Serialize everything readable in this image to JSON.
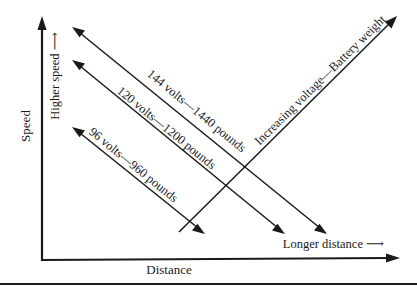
{
  "diagram": {
    "axes": {
      "y_label": "Speed",
      "x_label": "Distance",
      "y_direction_label": "Higher speed ⟶",
      "x_direction_label": "Longer distance ⟶"
    },
    "lines": [
      {
        "label": "144 volts—1440 pounds",
        "voltage": 144,
        "weight_lb": 1440
      },
      {
        "label": "120 volts—1200 pounds",
        "voltage": 120,
        "weight_lb": 1200
      },
      {
        "label": "96 volts—960 pounds",
        "voltage": 96,
        "weight_lb": 960
      }
    ],
    "trend_label": "Increasing voltage—Battery weight"
  }
}
